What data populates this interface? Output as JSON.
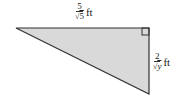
{
  "diagram": {
    "type": "right-triangle",
    "fill_color": "#d9d9d9",
    "stroke_color": "#333333",
    "top_side": {
      "numerator": "5",
      "radical": "√",
      "radicand": "5",
      "unit": "ft"
    },
    "right_side": {
      "numerator": "2",
      "radical": "√",
      "radicand": "y",
      "unit": "ft"
    },
    "right_angle_marker": true
  }
}
